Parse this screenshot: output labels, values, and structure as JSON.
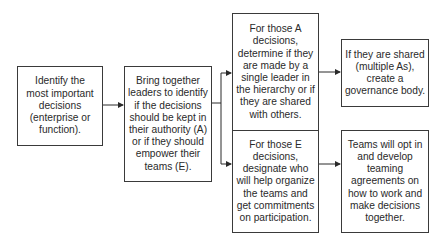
{
  "diagram": {
    "type": "flowchart",
    "nodes": [
      {
        "id": "identify",
        "text": "Identify the most important decisions (enterprise or function)."
      },
      {
        "id": "bring_together",
        "text": "Bring together leaders to identify if the decisions should be kept in their authority (A) or if they should empower their teams (E)."
      },
      {
        "id": "a_decisions",
        "text": "For those A decisions, determine if they are made by a single leader in the hierarchy or if they are shared with others."
      },
      {
        "id": "e_decisions",
        "text": "For those E decisions, designate who will help organize the teams and get commitments on participation."
      },
      {
        "id": "governance",
        "text": "If they are shared (multiple As), create a governance body."
      },
      {
        "id": "teaming",
        "text": "Teams will opt in and develop teaming agreements on how to work and make decisions together."
      }
    ],
    "edges": [
      {
        "from": "identify",
        "to": "bring_together"
      },
      {
        "from": "bring_together",
        "to": "a_decisions"
      },
      {
        "from": "bring_together",
        "to": "e_decisions"
      },
      {
        "from": "a_decisions",
        "to": "governance"
      },
      {
        "from": "e_decisions",
        "to": "teaming"
      }
    ],
    "colors": {
      "line": "#2a2a2a",
      "border": "#3a3a3a",
      "background": "#ffffff"
    }
  }
}
